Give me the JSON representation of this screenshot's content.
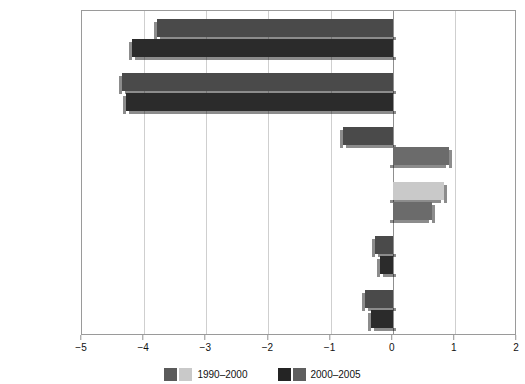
{
  "chart_data": {
    "type": "bar",
    "orientation": "horizontal",
    "title": "",
    "xlabel": "",
    "ylabel": "",
    "xlim": [
      -5,
      2
    ],
    "xticks": [
      -5,
      -4,
      -3,
      -2,
      -1,
      0,
      1,
      2
    ],
    "xtick_labels": [
      "−5",
      "−4",
      "−3",
      "−2",
      "−1",
      "0",
      "1",
      "2"
    ],
    "grid": true,
    "grid_axis": "x",
    "legend_position": "bottom",
    "categories": [
      "South America",
      "Africa",
      "Asia",
      "Europe",
      "North and\nCentral America",
      "Oceania"
    ],
    "series": [
      {
        "name": "1990–2000",
        "color": "#4d4d4d",
        "values": [
          -3.8,
          -4.35,
          -0.8,
          0.82,
          -0.28,
          -0.45
        ]
      },
      {
        "name": "2000–2005",
        "color": "#2b2b2b",
        "values": [
          -4.2,
          -4.3,
          0.9,
          0.63,
          -0.2,
          -0.35
        ]
      }
    ]
  },
  "legend": {
    "entries": [
      {
        "label": "1990–2000",
        "swatch_dark": "#5a5a5a",
        "swatch_light": "#c9c9c9"
      },
      {
        "label": "2000–2005",
        "swatch_dark": "#242424",
        "swatch_light": "#5f5f5f"
      }
    ]
  },
  "colors": {
    "bar_1990_2000_neg": "#4a4a4a",
    "bar_1990_2000_pos": "#c9c9c9",
    "bar_2000_2005_neg": "#2b2b2b",
    "bar_2000_2005_pos": "#6b6b6b",
    "grid": "#cfcfcf",
    "axis": "#9a9a9a",
    "zero_line": "#8f8f8f",
    "text": "#111111",
    "background": "#ffffff"
  }
}
